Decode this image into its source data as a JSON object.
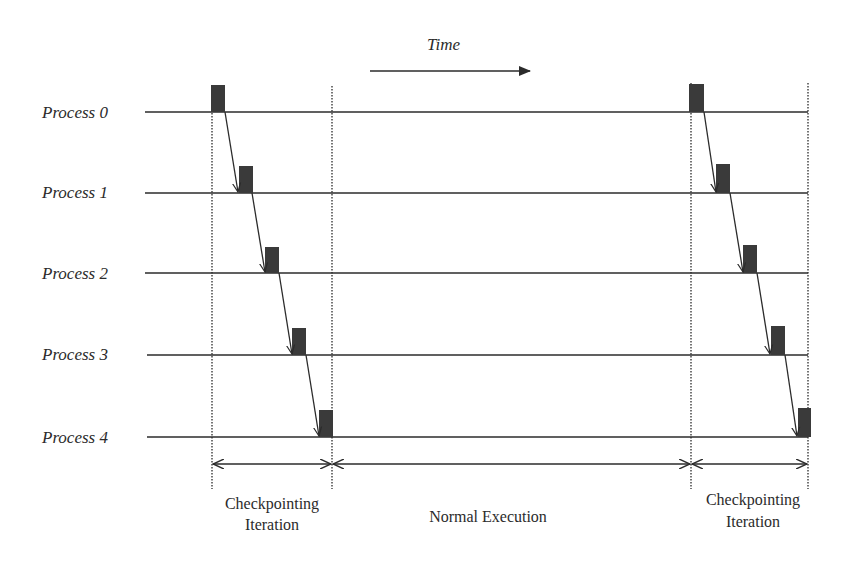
{
  "diagram": {
    "type": "timeline",
    "time_axis": {
      "label": "Time",
      "direction": "right"
    },
    "processes": [
      {
        "label": "Process 0",
        "y": 112
      },
      {
        "label": "Process 1",
        "y": 193
      },
      {
        "label": "Process 2",
        "y": 273
      },
      {
        "label": "Process 3",
        "y": 355
      },
      {
        "label": "Process 4",
        "y": 437
      }
    ],
    "checkpoint_groups": [
      {
        "rect_x": [
          211,
          238,
          265,
          292,
          319
        ]
      },
      {
        "rect_x": [
          689,
          716,
          743,
          770,
          797
        ]
      }
    ],
    "phase_boundaries_x": [
      212,
      332,
      691,
      808
    ],
    "phases": [
      {
        "line1": "Checkpointing",
        "line2": "Iteration"
      },
      {
        "line1": "Normal Execution",
        "line2": ""
      },
      {
        "line1": "Checkpointing",
        "line2": "Iteration"
      }
    ],
    "colors": {
      "line": "#2b2b2b",
      "checkpoint_fill": "#3a3a3a",
      "text": "#2b2b2b"
    }
  }
}
